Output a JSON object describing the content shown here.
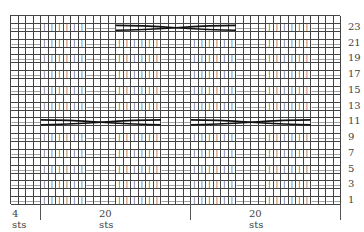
{
  "chart_data": {
    "type": "table",
    "columns": 44,
    "rows": 24,
    "column_pattern": [
      "P",
      "P",
      "P",
      "P",
      "K",
      "K",
      "K",
      "K",
      "K",
      "K",
      "P",
      "P",
      "P",
      "P",
      "K",
      "K",
      "K",
      "K",
      "K",
      "K",
      "P",
      "P",
      "P",
      "P",
      "K",
      "K",
      "K",
      "K",
      "K",
      "K",
      "P",
      "P",
      "P",
      "P",
      "K",
      "K",
      "K",
      "K",
      "K",
      "K",
      "P",
      "P",
      "P",
      "P"
    ],
    "symbols": {
      "K": "|",
      "P": "—"
    },
    "cable_rows": [
      {
        "row": 23,
        "start_col": 14,
        "end_col": 29
      },
      {
        "row": 11,
        "start_col": 4,
        "end_col": 19
      },
      {
        "row": 11,
        "start_col": 24,
        "end_col": 39
      }
    ],
    "row_labels": [
      "1",
      "3",
      "5",
      "7",
      "9",
      "11",
      "13",
      "15",
      "17",
      "19",
      "21",
      "23"
    ],
    "footer_labels": [
      {
        "text": "4 sts",
        "cols": 4
      },
      {
        "text": "20 sts",
        "cols": 20
      },
      {
        "text": "20 sts",
        "cols": 20
      }
    ],
    "colors": {
      "grid": "#444444",
      "text": "#444444",
      "cable": "#111111"
    }
  }
}
